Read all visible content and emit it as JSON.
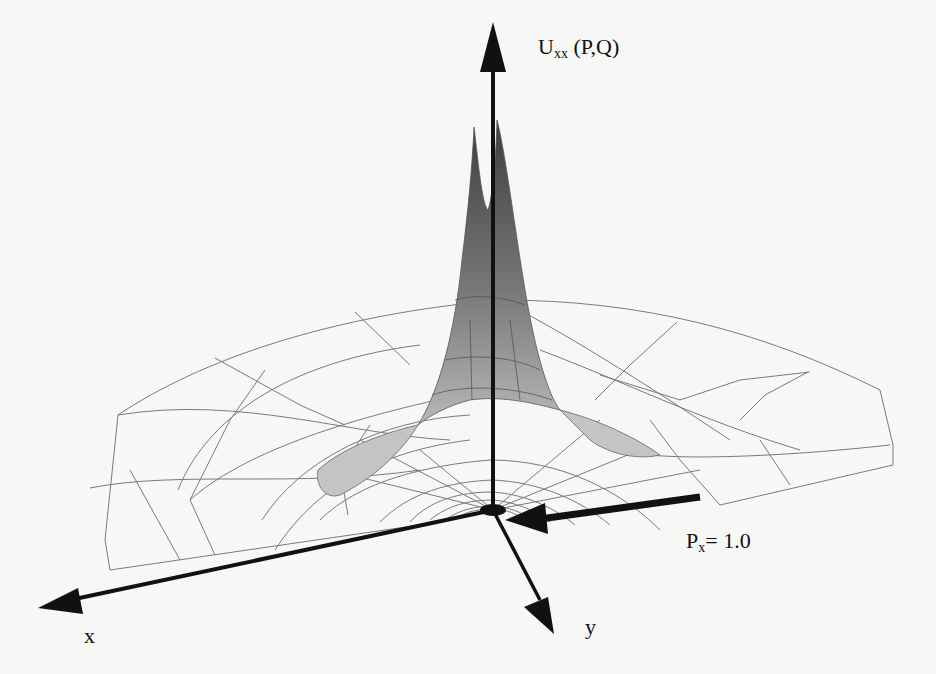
{
  "diagram": {
    "type": "3d-surface-plot",
    "colors": {
      "background": "#f7f7f5",
      "axes": "#111111",
      "mesh": "#777777",
      "surface_dark": "#555555",
      "surface_light": "#bdbdbd"
    },
    "axes": {
      "vertical": {
        "label_main": "U",
        "label_sub": "xx",
        "label_suffix": " (P,Q)"
      },
      "x": {
        "label": "x"
      },
      "y": {
        "label": "y"
      }
    },
    "load": {
      "label_main": "P",
      "label_sub": "x",
      "label_suffix": "= 1.0"
    }
  }
}
